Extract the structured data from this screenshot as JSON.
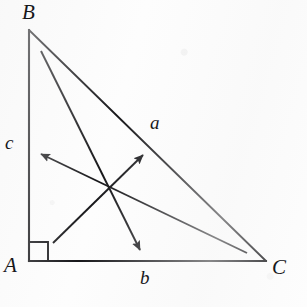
{
  "figure": {
    "width": 307,
    "height": 307,
    "background_color": "#fdfdfd",
    "stroke_color": "#17171a",
    "vertices": [
      {
        "name": "B",
        "label": "B",
        "point": [
          29,
          30
        ],
        "label_pos": [
          22,
          2
        ]
      },
      {
        "name": "A",
        "label": "A",
        "point": [
          29,
          261
        ],
        "label_pos": [
          4,
          255
        ]
      },
      {
        "name": "C",
        "label": "C",
        "point": [
          266,
          261
        ],
        "label_pos": [
          272,
          257
        ]
      }
    ],
    "sides": [
      {
        "name": "side-c",
        "label": "c",
        "from": "B",
        "to": "A",
        "label_pos": [
          5,
          133
        ]
      },
      {
        "name": "side-b",
        "label": "b",
        "from": "A",
        "to": "C",
        "label_pos": [
          140,
          268
        ]
      },
      {
        "name": "side-a",
        "label": "a",
        "from": "B",
        "to": "C",
        "label_pos": [
          150,
          113
        ]
      }
    ],
    "right_angle": {
      "name": "right-angle-mark-at-A",
      "vertex": "A",
      "size": 19
    },
    "vectors": [
      {
        "name": "vector-down-right",
        "from": [
          41,
          51
        ],
        "to": [
          140,
          250
        ],
        "arrowhead": "to"
      },
      {
        "name": "vector-up-left",
        "from": [
          247,
          253
        ],
        "to": [
          41,
          154
        ],
        "arrowhead": "to"
      },
      {
        "name": "vector-up-right",
        "from": [
          53,
          243
        ],
        "to": [
          143,
          155
        ],
        "arrowhead": "to"
      }
    ],
    "intersection_point": [
      107,
      188
    ]
  }
}
